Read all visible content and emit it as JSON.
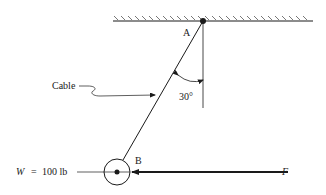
{
  "diagram": {
    "labels": {
      "point_a": "A",
      "point_b": "B",
      "cable": "Cable",
      "angle": "30°",
      "weight_symbol": "W",
      "weight_eq": "=",
      "weight_value": "100 lb",
      "force": "F"
    },
    "geometry": {
      "ceiling": {
        "x1": 113,
        "x2": 313,
        "y": 21
      },
      "point_a": {
        "x": 203,
        "y": 21
      },
      "point_b": {
        "x": 117,
        "y": 172,
        "radius": 13
      },
      "angle_deg": 30,
      "force_line": {
        "x_start": 288,
        "x_end": 132,
        "y": 172
      }
    },
    "colors": {
      "line": "#1a1a1a",
      "background": "#ffffff"
    }
  }
}
